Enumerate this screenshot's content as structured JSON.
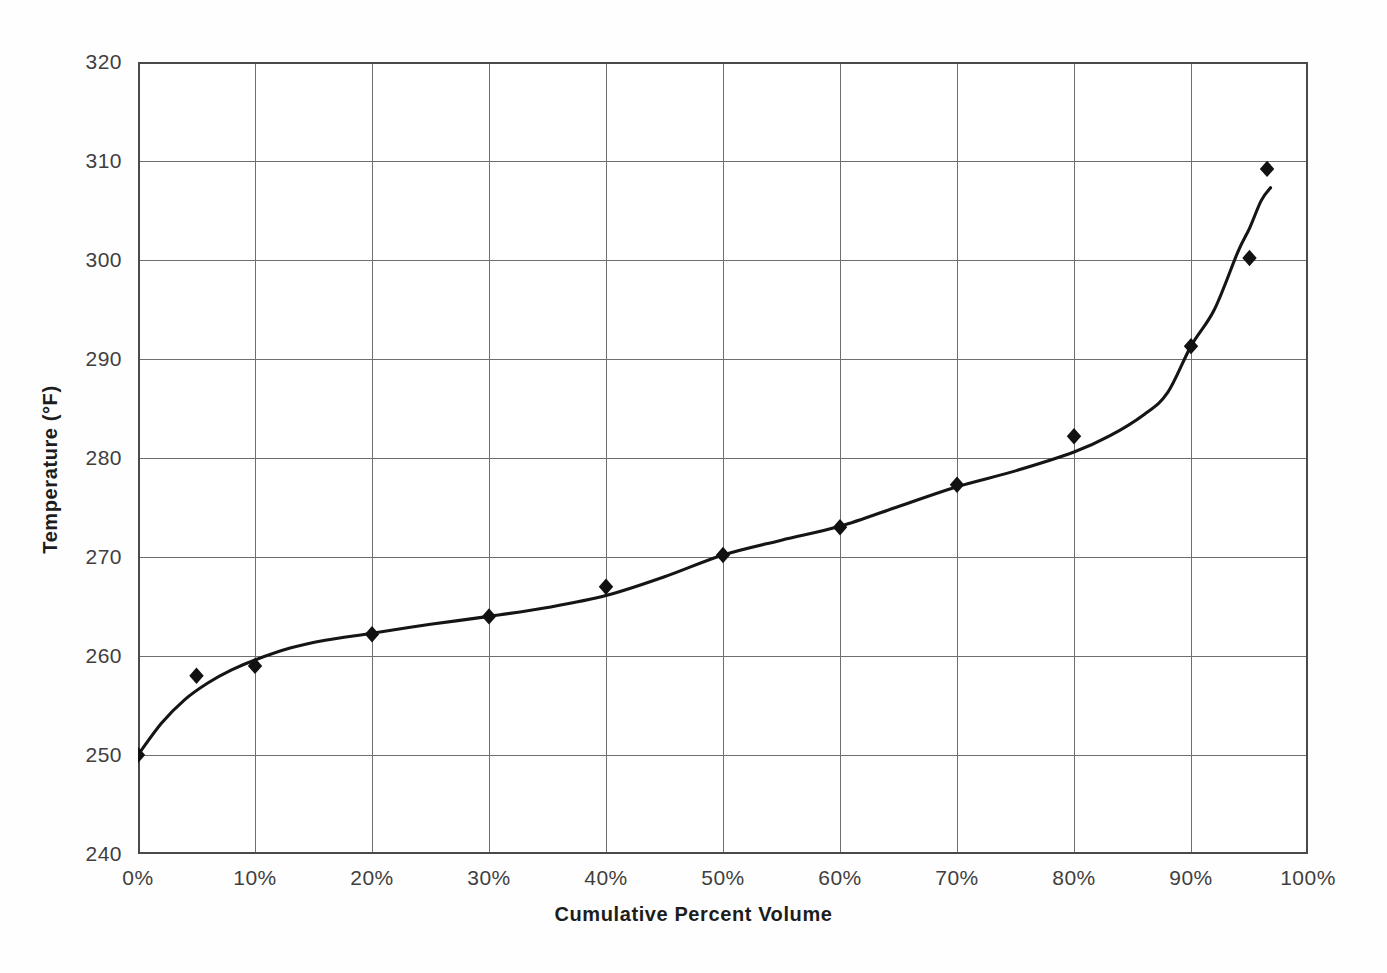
{
  "chart_data": {
    "type": "scatter",
    "title": "",
    "subtitle": "",
    "xlabel": "Cumulative Percent Volume",
    "ylabel": "Temperature (°F)",
    "xlim": [
      0,
      100
    ],
    "ylim": [
      240,
      320
    ],
    "x_tick_labels": [
      "0%",
      "10%",
      "20%",
      "30%",
      "40%",
      "50%",
      "60%",
      "70%",
      "80%",
      "90%",
      "100%"
    ],
    "x_tick_values": [
      0,
      10,
      20,
      30,
      40,
      50,
      60,
      70,
      80,
      90,
      100
    ],
    "y_tick_labels": [
      "240",
      "250",
      "260",
      "270",
      "280",
      "290",
      "300",
      "310",
      "320"
    ],
    "y_tick_values": [
      240,
      250,
      260,
      270,
      280,
      290,
      300,
      310,
      320
    ],
    "grid": true,
    "grid_axes": "both",
    "legend": null,
    "legend_position": "none",
    "annotations": [],
    "series": [
      {
        "name": "Distillation data points",
        "type": "scatter",
        "marker": "diamond",
        "color": "#111111",
        "x": [
          0,
          5,
          10,
          20,
          30,
          40,
          50,
          60,
          70,
          80,
          90,
          95,
          96.5
        ],
        "y": [
          250.0,
          258.0,
          259.0,
          262.2,
          264.0,
          267.0,
          270.2,
          273.0,
          277.3,
          282.2,
          291.3,
          300.2,
          309.2
        ]
      },
      {
        "name": "Fitted distillation curve",
        "type": "line",
        "color": "#151515",
        "x": [
          0,
          2,
          4,
          6,
          8,
          10,
          13,
          16,
          20,
          25,
          30,
          35,
          40,
          45,
          50,
          55,
          60,
          65,
          70,
          75,
          80,
          83,
          86,
          88,
          90,
          92,
          94,
          95,
          96,
          96.8
        ],
        "y": [
          250.0,
          253.2,
          255.6,
          257.3,
          258.6,
          259.6,
          260.8,
          261.6,
          262.3,
          263.2,
          264.0,
          264.9,
          266.1,
          268.0,
          270.2,
          271.7,
          273.1,
          275.1,
          277.1,
          278.7,
          280.6,
          282.2,
          284.4,
          286.6,
          291.3,
          295.0,
          300.8,
          303.2,
          306.0,
          307.3
        ]
      }
    ]
  },
  "axis_colors": {
    "grid": "#6f6f6f",
    "frame": "#4a4a4a",
    "curve": "#151515",
    "marker": "#111111",
    "tick_text": "#3f3f3f",
    "title_text": "#1d1d1d",
    "background": "#ffffff"
  }
}
